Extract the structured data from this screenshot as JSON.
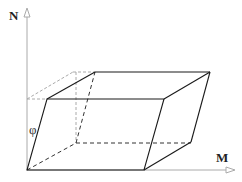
{
  "diagram": {
    "axes": {
      "vertical_label": "N",
      "horizontal_label": "M"
    },
    "angle_label": "φ",
    "colors": {
      "solid_edge": "#1a1a1a",
      "hidden_edge": "#333333",
      "axis": "#aaaaaa",
      "projection": "#aaaaaa"
    }
  }
}
